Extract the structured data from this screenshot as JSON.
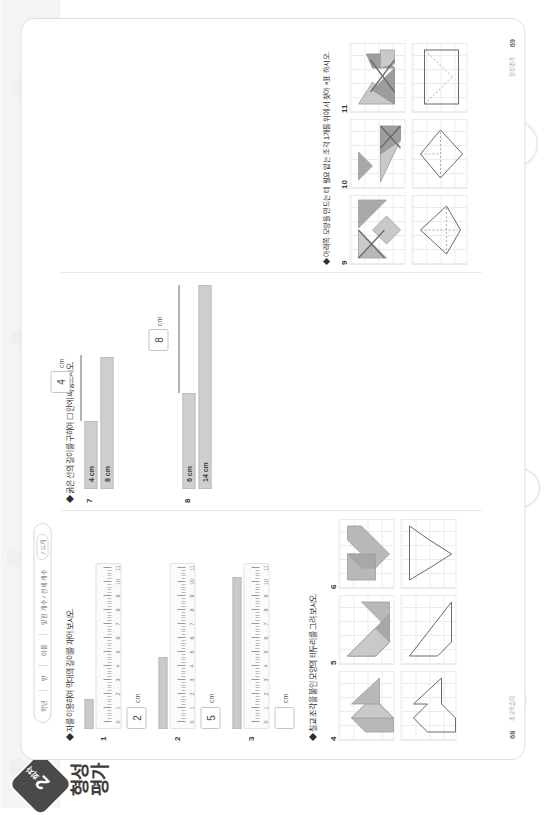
{
  "header": {
    "round_number": "2",
    "round_word": "회차",
    "title": "형성 평가",
    "meta": {
      "grade_label": "학년",
      "class_label": "반",
      "name_label": "이름",
      "date_label": "맞힌 개수 / 전체 개수",
      "score_label": "/ 11개"
    }
  },
  "sections": {
    "ruler": {
      "instruction": "◆ 자를 이용하여 막대의 길이를 재어 보시오.",
      "unit": "cm",
      "problems": [
        {
          "num": "1",
          "bar_cm": 2,
          "answer": "2"
        },
        {
          "num": "2",
          "bar_cm": 5,
          "answer": "5"
        },
        {
          "num": "3",
          "bar_cm": 11,
          "answer": ""
        }
      ],
      "ruler_ticks": [
        "0",
        "1",
        "2",
        "3",
        "4",
        "5",
        "6",
        "7",
        "8",
        "9",
        "10",
        "11"
      ]
    },
    "compare": {
      "instruction": "◆ 굵은 선의 길이를 구하여 ☐ 안에 써넣으시오.",
      "unit": "cm",
      "problems": [
        {
          "num": "7",
          "bar_label": "4 cm",
          "line_label": "8 cm",
          "answer": "4"
        },
        {
          "num": "8",
          "bar_label": "6 cm",
          "line_label": "14 cm",
          "answer": "8"
        }
      ]
    },
    "tangram_outline": {
      "instruction": "◆ 칠교 조각을 붙인 모양의 테두리를 그려 보시오.",
      "problems": [
        {
          "num": "4"
        },
        {
          "num": "5"
        },
        {
          "num": "6"
        }
      ]
    },
    "tangram_find": {
      "instruction": "◆ 아래쪽 모양을 만드는 데 필요 없는 조각 1개를 위에서 찾아 ×표 하시오.",
      "problems": [
        {
          "num": "9"
        },
        {
          "num": "10"
        },
        {
          "num": "11"
        }
      ]
    }
  },
  "footer": {
    "page_left": "68",
    "page_right": "69",
    "label_left": "초고학습지",
    "label_right": "형성평가"
  },
  "colors": {
    "fill_dark": "#9d9d9f",
    "fill_mid": "#b8b8ba",
    "fill_light": "#d2d2d4",
    "stroke": "#8a8a8c",
    "grid": "#ececee"
  }
}
